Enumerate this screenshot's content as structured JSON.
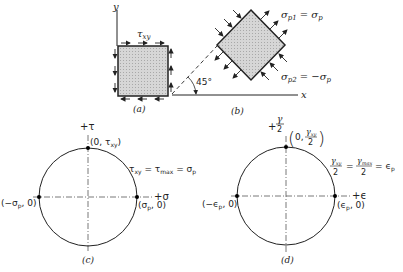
{
  "panel_a": {
    "caption": "(a)",
    "axis_y": "y",
    "shear_label": "τ",
    "shear_sub": "xy"
  },
  "panel_b": {
    "caption": "(b)",
    "axis_x": "x",
    "angle": "45°",
    "sigma_p1": {
      "sym": "σ",
      "sub": "p1",
      "eq": "= σ",
      "eq_sub": "p"
    },
    "sigma_p2": {
      "sym": "σ",
      "sub": "p2",
      "eq": "= −σ",
      "eq_sub": "p"
    }
  },
  "panel_c": {
    "caption": "(c)",
    "axis_v": "+τ",
    "axis_h": "+σ",
    "top_point": "(0, τxy)",
    "top_point_parts": {
      "open": "(0, τ",
      "sub": "xy",
      "close": ")"
    },
    "left_point": {
      "open": "(−σ",
      "sub": "p",
      "close": ", 0)"
    },
    "right_point": {
      "open": "(σ",
      "sub": "p",
      "close": ", 0)"
    },
    "relation": {
      "a": "τ",
      "a_sub": "xy",
      "b": " = τ",
      "b_sub": "max",
      "c": " = σ",
      "c_sub": "p"
    }
  },
  "panel_d": {
    "caption": "(d)",
    "axis_v_plus": "+",
    "axis_v_num": "γ",
    "axis_v_den": "2",
    "axis_h": "+ϵ",
    "top_point": {
      "open": "0,",
      "num": "γ",
      "num_sub": "xy",
      "den": "2"
    },
    "left_point": {
      "open": "(−ϵ",
      "sub": "p",
      "close": ", 0)"
    },
    "right_point": {
      "open": "(ϵ",
      "sub": "p",
      "close": ", 0)"
    },
    "relation": {
      "n1": "γ",
      "n1_sub": "xy",
      "d1": "2",
      "n2": "γ",
      "n2_sub": "max",
      "d2": "2",
      "eq": "=",
      "end": "= ϵ",
      "end_sub": "p"
    }
  },
  "colors": {
    "ink": "#222222",
    "fill": "#cfcfcf",
    "dash": "#555555"
  }
}
